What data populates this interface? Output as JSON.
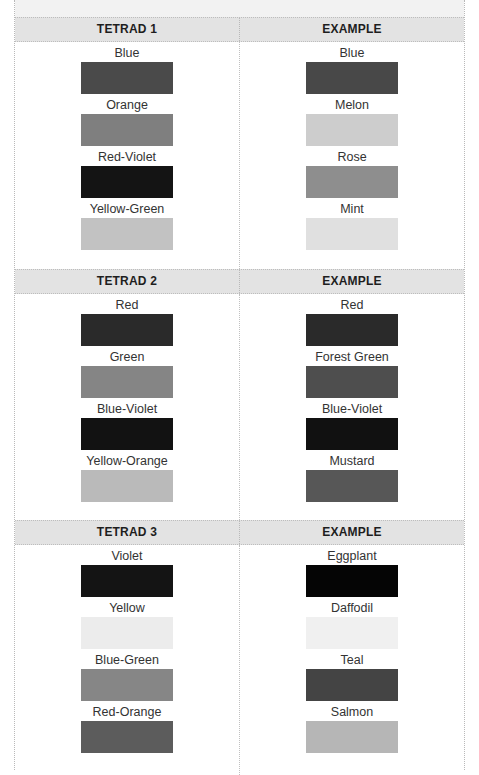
{
  "sections": [
    {
      "header": "TETRAD 1",
      "example_header": "EXAMPLE",
      "tetrad": [
        {
          "name": "Blue",
          "color": "#4a4a4a"
        },
        {
          "name": "Orange",
          "color": "#7f7f7f"
        },
        {
          "name": "Red-Violet",
          "color": "#141414"
        },
        {
          "name": "Yellow-Green",
          "color": "#c2c2c2"
        }
      ],
      "example": [
        {
          "name": "Blue",
          "color": "#484848"
        },
        {
          "name": "Melon",
          "color": "#cdcdcd"
        },
        {
          "name": "Rose",
          "color": "#8e8e8e"
        },
        {
          "name": "Mint",
          "color": "#e0e0e0"
        }
      ]
    },
    {
      "header": "TETRAD 2",
      "example_header": "EXAMPLE",
      "tetrad": [
        {
          "name": "Red",
          "color": "#2a2a2a"
        },
        {
          "name": "Green",
          "color": "#858585"
        },
        {
          "name": "Blue-Violet",
          "color": "#121212"
        },
        {
          "name": "Yellow-Orange",
          "color": "#bababa"
        }
      ],
      "example": [
        {
          "name": "Red",
          "color": "#2a2a2a"
        },
        {
          "name": "Forest Green",
          "color": "#4e4e4e"
        },
        {
          "name": "Blue-Violet",
          "color": "#111111"
        },
        {
          "name": "Mustard",
          "color": "#575757"
        }
      ]
    },
    {
      "header": "TETRAD 3",
      "example_header": "EXAMPLE",
      "tetrad": [
        {
          "name": "Violet",
          "color": "#141414"
        },
        {
          "name": "Yellow",
          "color": "#ececec"
        },
        {
          "name": "Blue-Green",
          "color": "#868686"
        },
        {
          "name": "Red-Orange",
          "color": "#5c5c5c"
        }
      ],
      "example": [
        {
          "name": "Eggplant",
          "color": "#050505"
        },
        {
          "name": "Daffodil",
          "color": "#f0f0f0"
        },
        {
          "name": "Teal",
          "color": "#444444"
        },
        {
          "name": "Salmon",
          "color": "#b6b6b6"
        }
      ]
    }
  ]
}
